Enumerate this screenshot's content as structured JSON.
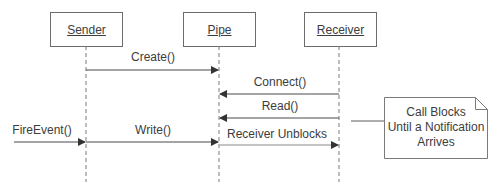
{
  "diagram": {
    "type": "sequence",
    "actors": [
      {
        "id": "sender",
        "label": "Sender"
      },
      {
        "id": "pipe",
        "label": "Pipe"
      },
      {
        "id": "receiver",
        "label": "Receiver"
      }
    ],
    "messages": [
      {
        "label": "Create()",
        "from": "sender",
        "to": "pipe"
      },
      {
        "label": "Connect()",
        "from": "receiver",
        "to": "pipe"
      },
      {
        "label": "Read()",
        "from": "receiver",
        "to": "pipe"
      },
      {
        "label": "FireEvent()",
        "from": "external",
        "to": "sender"
      },
      {
        "label": "Write()",
        "from": "sender",
        "to": "pipe"
      },
      {
        "label": "Receiver Unblocks",
        "from": "pipe",
        "to": "receiver"
      }
    ],
    "note": {
      "lines": [
        "Call Blocks",
        "Until a Notification",
        "Arrives"
      ],
      "attached_to": "Read()"
    },
    "colors": {
      "line": "#4a4a4a",
      "box_border": "#6b6b6b",
      "lifeline": "#7a7a7a",
      "background": "#ffffff"
    }
  }
}
